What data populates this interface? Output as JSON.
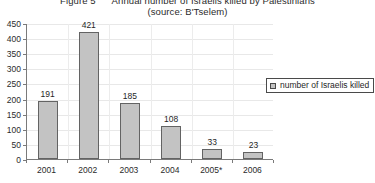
{
  "chart_data": {
    "type": "bar",
    "title": "Figure 5      Annual number of Israelis killed by Palestinians",
    "subtitle": "(source: B'Tselem)",
    "categories": [
      "2001",
      "2002",
      "2003",
      "2004",
      "2005*",
      "2006"
    ],
    "values": [
      191,
      421,
      185,
      108,
      33,
      23
    ],
    "series": [
      {
        "name": "number of Israelis killed",
        "values": [
          191,
          421,
          185,
          108,
          33,
          23
        ]
      }
    ],
    "xlabel": "",
    "ylabel": "",
    "ylim": [
      0,
      450
    ],
    "ytick_step": 50,
    "yticks": [
      "450",
      "400",
      "350",
      "300",
      "250",
      "200",
      "150",
      "100",
      "50",
      "0"
    ],
    "grid": true,
    "legend_position": "right",
    "legend_entries": [
      "number of Israelis killed"
    ],
    "bar_color": "#c3c3c3",
    "bar_border_color": "#636363",
    "gridline_color": "#e8e8e8",
    "axis_color": "#7a7a7a"
  }
}
